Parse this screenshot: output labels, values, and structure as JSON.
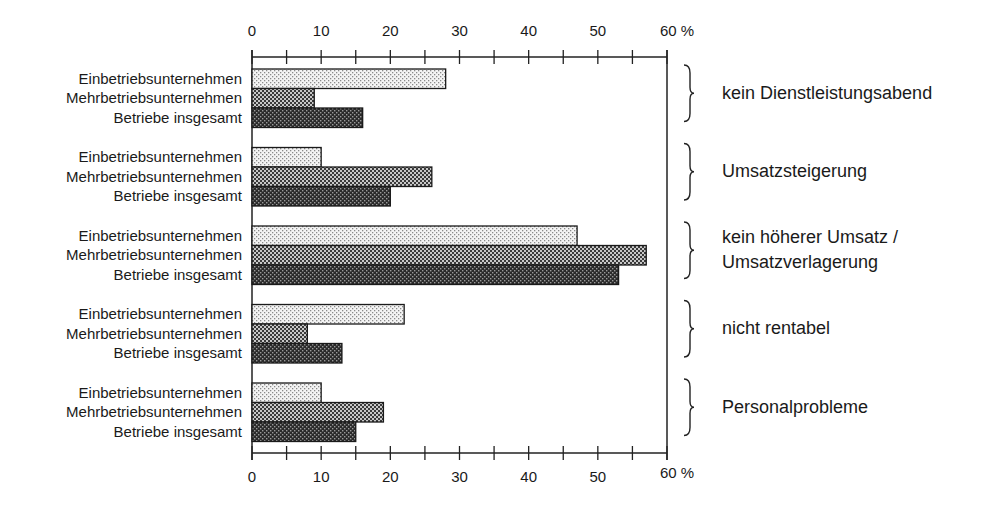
{
  "chart_data": {
    "type": "bar",
    "orientation": "horizontal",
    "title": "",
    "xlabel": "%",
    "ylabel": "",
    "xlim": [
      0,
      60
    ],
    "x_ticks": [
      "0",
      "10",
      "20",
      "30",
      "40",
      "50",
      "60 %"
    ],
    "minor_tick_step": 5,
    "grid": false,
    "legend": null,
    "series_names": [
      "Einbetriebsunternehmen",
      "Mehrbetriebsunternehmen",
      "Betriebe insgesamt"
    ],
    "series_patterns": [
      "light-dots",
      "medium-dots",
      "dark-dots"
    ],
    "groups": [
      {
        "label": "kein Dienstleistungsabend",
        "values": [
          28,
          9,
          16
        ]
      },
      {
        "label": "Umsatzsteigerung",
        "values": [
          10,
          26,
          20
        ]
      },
      {
        "label": "kein höherer Umsatz / Umsatzverlagerung",
        "label_lines": [
          "kein höherer Umsatz /",
          "Umsatzverlagerung"
        ],
        "values": [
          47,
          57,
          53
        ]
      },
      {
        "label": "nicht rentabel",
        "values": [
          22,
          8,
          13
        ]
      },
      {
        "label": "Personalprobleme",
        "values": [
          10,
          19,
          15
        ]
      }
    ]
  }
}
